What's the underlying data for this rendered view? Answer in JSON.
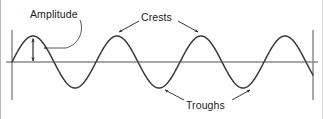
{
  "diagram": {
    "background_color": "#ffffff",
    "stroke_color": "#333333",
    "baseline_color": "#808080",
    "text_color": "#1a1a1a",
    "labels": {
      "amplitude": "Amplitude",
      "crests": "Crests",
      "troughs": "Troughs"
    },
    "annotations": [
      {
        "name": "amplitude",
        "text": "Amplitude",
        "pointer": "curved-leader-to-double-arrow",
        "target_x": 33,
        "target_y": 50
      },
      {
        "name": "crests",
        "text": "Crests",
        "pointer": "two-straight-arrows-down",
        "targets": [
          {
            "x": 117,
            "y": 34
          },
          {
            "x": 200,
            "y": 34
          }
        ]
      },
      {
        "name": "troughs",
        "text": "Troughs",
        "pointer": "two-straight-arrows-up",
        "targets": [
          {
            "x": 163,
            "y": 88
          },
          {
            "x": 248,
            "y": 88
          }
        ]
      }
    ]
  },
  "chart_data": {
    "type": "line",
    "title": "",
    "subtitle": "",
    "xlabel": "",
    "ylabel": "",
    "grid": false,
    "legend": null,
    "axis": {
      "baseline_y": 62,
      "left_marker_x": 12,
      "right_marker_x": 313,
      "marker_top_y": 30,
      "marker_bottom_y": 100
    },
    "wave": {
      "form": "sine",
      "amplitude_px": 26,
      "wavelength_px": 84,
      "x_start": 12,
      "x_end": 313,
      "cycles": 3.6,
      "phase": "starts at baseline rising"
    },
    "crests": [
      {
        "x": 33,
        "y": 36
      },
      {
        "x": 117,
        "y": 36
      },
      {
        "x": 200,
        "y": 36
      },
      {
        "x": 289,
        "y": 36
      }
    ],
    "troughs": [
      {
        "x": 75,
        "y": 88
      },
      {
        "x": 163,
        "y": 88
      },
      {
        "x": 248,
        "y": 88
      }
    ],
    "zero_crossings": [
      12,
      54,
      96,
      138,
      180,
      222,
      266,
      310
    ],
    "amplitude_marker": {
      "x": 33,
      "y_top": 37,
      "y_bottom": 62,
      "value_px": 25,
      "style": "double-headed-vertical-arrow"
    }
  }
}
